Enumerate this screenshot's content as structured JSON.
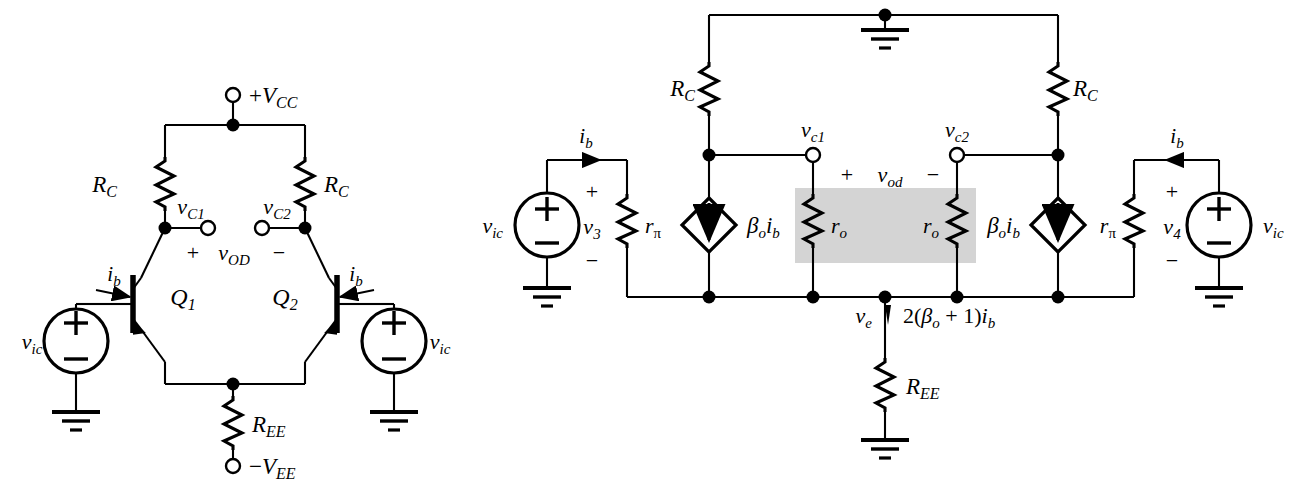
{
  "figure": {
    "background_color": "#ffffff",
    "line_color": "#000000",
    "shade_color": "#d4d4d4"
  },
  "left_circuit": {
    "name": "differential-amplifier-schematic",
    "supply_positive": "+V_CC",
    "supply_negative": "−V_EE",
    "resistor_collector_left": "R_C",
    "resistor_collector_right": "R_C",
    "resistor_emitter": "R_EE",
    "node_vc1": "v_C1",
    "node_vc2": "v_C2",
    "output_plus": "+",
    "output_label": "v_OD",
    "output_minus": "−",
    "transistor_left": "Q_1",
    "transistor_right": "Q_2",
    "current_left": "i_b",
    "current_right": "i_b",
    "source_left": "v_ic",
    "source_right": "v_ic",
    "source_polarity_plus": "+",
    "source_polarity_minus": "−"
  },
  "right_circuit": {
    "name": "small-signal-equivalent-circuit",
    "resistor_collector_left": "R_C",
    "resistor_collector_right": "R_C",
    "resistor_pi_left": "r_π",
    "resistor_pi_right": "r_π",
    "resistor_o_left": "r_o",
    "resistor_o_right": "r_o",
    "resistor_emitter": "R_EE",
    "node_vc1": "v_c1",
    "node_vc2": "v_c2",
    "node_ve": "v_e",
    "emitter_current": "2(β_o + 1)i_b",
    "dependent_source_left": "β_o i_b",
    "dependent_source_right": "β_o i_b",
    "output_plus": "+",
    "output_label": "v_od",
    "output_minus": "−",
    "v3_label": "v_3",
    "v4_label": "v_4",
    "current_left": "i_b",
    "current_right": "i_b",
    "source_left": "v_ic",
    "source_right": "v_ic",
    "polarity_plus": "+",
    "polarity_minus": "−"
  },
  "math": {
    "beta": "β",
    "pi": "π",
    "sub_o": "o",
    "sub_b": "b",
    "sub_c1": "c1",
    "sub_c2": "c2",
    "sub_e": "e",
    "sub_ic": "ic",
    "sub_C": "C",
    "sub_CC": "CC",
    "sub_EE": "EE",
    "sub_OD": "OD",
    "sub_od": "od",
    "sub_1": "1",
    "sub_2": "2",
    "sub_3": "3",
    "sub_4": "4",
    "char_v": "v",
    "char_i": "i",
    "char_R": "R",
    "char_r": "r",
    "char_Q": "Q",
    "char_V": "V",
    "paren_expr": "2(",
    "paren_mid": " + 1)",
    "minus_sign": "−",
    "plus_sign": "+"
  }
}
